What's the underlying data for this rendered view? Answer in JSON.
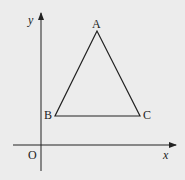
{
  "diagram": {
    "background": "#ececec",
    "stroke_color": "#222222",
    "axes": {
      "x_label": "x",
      "y_label": "y",
      "origin_label": "O"
    },
    "triangle": {
      "vertices": [
        {
          "name": "A",
          "label": "A"
        },
        {
          "name": "B",
          "label": "B"
        },
        {
          "name": "C",
          "label": "C"
        }
      ]
    }
  }
}
